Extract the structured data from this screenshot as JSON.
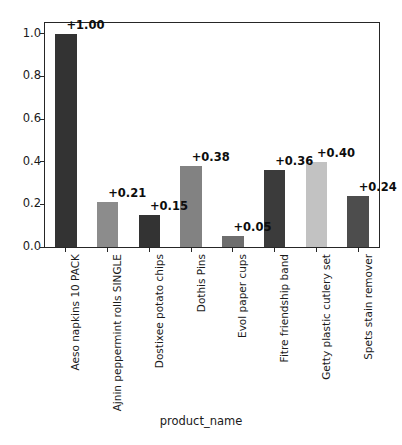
{
  "chart_data": {
    "type": "bar",
    "title": "",
    "subtitle": "",
    "xlabel": "product_name",
    "ylabel": "",
    "ylim": [
      0.0,
      1.05
    ],
    "grid": false,
    "legend": null,
    "categories": [
      "Aeso napkins 10 PACK",
      "Ajnin peppermint rolls SINGLE",
      "Dostixee potato chips",
      "Dothis Pins",
      "Evol paper cups",
      "Fitre friendship band",
      "Getty plastic cutlery set",
      "Spets stain remover"
    ],
    "values": [
      1.0,
      0.21,
      0.15,
      0.38,
      0.05,
      0.36,
      0.4,
      0.24
    ],
    "value_labels": [
      "+1.00",
      "+0.21",
      "+0.15",
      "+0.38",
      "+0.05",
      "+0.36",
      "+0.40",
      "+0.24"
    ],
    "bar_colors": [
      "#333333",
      "#8c8c8c",
      "#333333",
      "#828282",
      "#6e6e6e",
      "#3b3b3b",
      "#c2c2c2",
      "#4d4d4d"
    ],
    "ytick_labels": [
      "0.0",
      "0.2",
      "0.4",
      "0.6",
      "0.8",
      "1.0"
    ],
    "ytick_values": [
      0.0,
      0.2,
      0.4,
      0.6,
      0.8,
      1.0
    ],
    "axis_color": "#262626",
    "background_color": "#ffffff"
  }
}
